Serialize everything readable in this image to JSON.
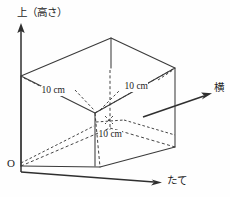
{
  "figure": {
    "background_color": "#fefefe",
    "line_color": "#3a3a3a",
    "axes": {
      "vertical": {
        "label": "上（高さ）",
        "meaning": "up (height)"
      },
      "horizontal_right_up": {
        "label": "横",
        "meaning": "width"
      },
      "horizontal_right_down": {
        "label": "たて",
        "meaning": "depth"
      },
      "origin": {
        "label": "O"
      }
    },
    "dimensions": [
      {
        "id": "width-dim",
        "label": "10 cm"
      },
      {
        "id": "depth-dim",
        "label": "10 cm"
      },
      {
        "id": "height-dim",
        "label": "10 cm"
      }
    ],
    "solid": {
      "shape": "cuboid",
      "edge_length_label": "10 cm"
    }
  }
}
